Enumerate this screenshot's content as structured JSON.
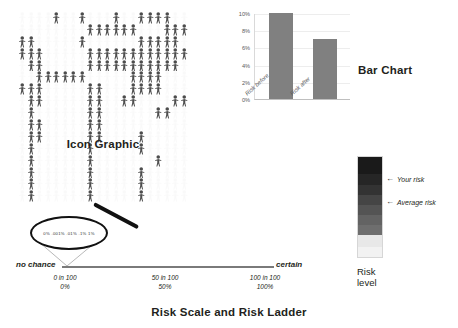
{
  "figure": {
    "panels": {
      "icon_graphic": {
        "caption": "Icon Graphic",
        "icon_name": "person-icon",
        "columns": 20,
        "rows": 16,
        "total_icons": 320,
        "highlighted_icons": 100,
        "highlight_color": "#4d4d4d",
        "background_icon_color": "#d9d9d9",
        "highlighted_cells": [
          4,
          7,
          11,
          14,
          15,
          16,
          17,
          28,
          29,
          30,
          31,
          32,
          33,
          37,
          38,
          39,
          40,
          41,
          47,
          54,
          55,
          56,
          57,
          58,
          60,
          61,
          62,
          68,
          69,
          70,
          71,
          72,
          73,
          74,
          75,
          76,
          77,
          78,
          79,
          81,
          82,
          88,
          89,
          90,
          91,
          92,
          93,
          94,
          95,
          96,
          97,
          98,
          102,
          103,
          104,
          105,
          106,
          107,
          113,
          114,
          115,
          116,
          120,
          121,
          122,
          128,
          129,
          133,
          134,
          135,
          136,
          141,
          142,
          148,
          149,
          152,
          153,
          158,
          159,
          161,
          168,
          169,
          176,
          177,
          181,
          182,
          188,
          189,
          201,
          202,
          208,
          209,
          214,
          221,
          228,
          234,
          241,
          248,
          256,
          261,
          268,
          274,
          281,
          288,
          294,
          301,
          308,
          314
        ]
      },
      "bar_chart": {
        "caption": "Bar Chart"
      },
      "risk_ladder": {
        "caption_line_1": "Risk",
        "caption_line_2": "level",
        "arrow_glyph": "←",
        "markers": [
          {
            "label": "Your risk",
            "position_pct": 72
          },
          {
            "label": "Average risk",
            "position_pct": 48
          }
        ],
        "bands": [
          {
            "color": "#1a1a1a",
            "height_pct": 18
          },
          {
            "color": "#262626",
            "height_pct": 10
          },
          {
            "color": "#333333",
            "height_pct": 10
          },
          {
            "color": "#454545",
            "height_pct": 10
          },
          {
            "color": "#545454",
            "height_pct": 10
          },
          {
            "color": "#636363",
            "height_pct": 10
          },
          {
            "color": "#6e6e6e",
            "height_pct": 10
          },
          {
            "color": "#e8e8e8",
            "height_pct": 11
          },
          {
            "color": "#f2f2f2",
            "height_pct": 11
          }
        ]
      },
      "risk_scale": {
        "caption": "Risk Scale and Risk Ladder",
        "left_end_label": "no chance",
        "right_end_label": "certain",
        "ticks": [
          {
            "fraction": "0 in 100",
            "percent": "0%"
          },
          {
            "fraction": "50 in 100",
            "percent": "50%"
          },
          {
            "fraction": "100 in 100",
            "percent": "100%"
          }
        ],
        "magnifier": {
          "icon_name": "magnifying-glass-icon",
          "zoomed_scale_text": "0%   .001%   .01%   .1%   1%"
        }
      }
    }
  },
  "chart_data": [
    {
      "type": "bar",
      "title": "Bar Chart",
      "categories": [
        "Risk before",
        "Risk after"
      ],
      "values": [
        10,
        7
      ],
      "xlabel": "",
      "ylabel": "",
      "ylim": [
        0,
        10
      ],
      "yticks": [
        0,
        2,
        4,
        6,
        8,
        10
      ],
      "ytick_labels": [
        "0%",
        "2%",
        "4%",
        "6%",
        "8%",
        "10%"
      ],
      "bar_color": "#808080",
      "grid": true,
      "legend": "none"
    },
    {
      "type": "bar",
      "title": "Risk Ladder",
      "orientation": "vertical-gradient",
      "categories": [
        "Average risk",
        "Your risk"
      ],
      "values": [
        48,
        72
      ],
      "ylabel": "Risk level",
      "ylim": [
        0,
        100
      ]
    },
    {
      "type": "table",
      "title": "Icon Graphic",
      "categories": [
        "affected",
        "unaffected"
      ],
      "values": [
        100,
        220
      ],
      "total": 320
    }
  ]
}
